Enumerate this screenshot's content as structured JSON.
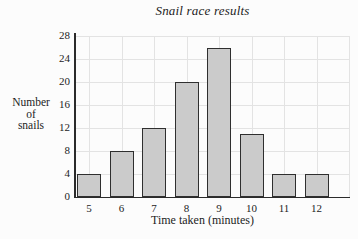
{
  "chart_data": {
    "type": "bar",
    "title": "Snail race results",
    "xlabel": "Time taken (minutes)",
    "ylabel": "Number of snails",
    "ylabel_lines": [
      "Number",
      "of",
      "snails"
    ],
    "categories": [
      5,
      6,
      7,
      8,
      9,
      10,
      11,
      12
    ],
    "values": [
      4,
      8,
      12,
      20,
      26,
      11,
      4,
      4
    ],
    "ylim": [
      0,
      28
    ],
    "yticks": [
      0,
      4,
      8,
      12,
      16,
      20,
      24,
      28
    ],
    "grid": "both",
    "legend": "none",
    "colors": {
      "bar_fill": "#cbcbcb",
      "bar_border": "#2f2f2f",
      "grid": "#e3e3e3",
      "axis": "#2b2b2b",
      "text": "#1c1c1c",
      "background": "#fcfcfc"
    }
  }
}
